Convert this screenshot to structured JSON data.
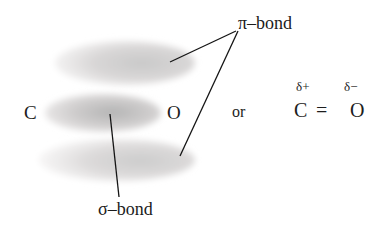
{
  "diagram": {
    "background_color": "#ffffff",
    "orbitals": [
      {
        "name": "pi-orbital-top",
        "label_for": "pi-bond",
        "cx": 125,
        "cy": 63,
        "rx": 70,
        "ry": 22,
        "fill_light": "#eceaea",
        "fill_dark": "#c9c9c9"
      },
      {
        "name": "sigma-orbital-middle",
        "label_for": "sigma-bond",
        "cx": 103,
        "cy": 113,
        "rx": 58,
        "ry": 19,
        "fill_light": "#e3e1e1",
        "fill_dark": "#b4b4b4"
      },
      {
        "name": "pi-orbital-bottom",
        "label_for": "pi-bond",
        "cx": 117,
        "cy": 160,
        "rx": 78,
        "ry": 21,
        "fill_light": "#efeded",
        "fill_dark": "#cccccc"
      }
    ],
    "leader_lines": [
      {
        "name": "pi-leader-top",
        "x1": 236,
        "y1": 31,
        "x2": 170,
        "y2": 62
      },
      {
        "name": "pi-leader-bottom",
        "x1": 238,
        "y1": 31,
        "x2": 180,
        "y2": 156
      },
      {
        "name": "sigma-leader",
        "x1": 110,
        "y1": 114,
        "x2": 119,
        "y2": 197
      }
    ],
    "line_color": "#141414",
    "line_width": 1.3
  },
  "labels": {
    "carbon": "C",
    "oxygen": "O",
    "pi_bond": "π–bond",
    "sigma_bond": "σ–bond",
    "or": "or"
  },
  "lewis": {
    "delta_plus": "δ+",
    "delta_minus": "δ−",
    "carbon": "C",
    "oxygen": "O",
    "double_bond": "="
  }
}
